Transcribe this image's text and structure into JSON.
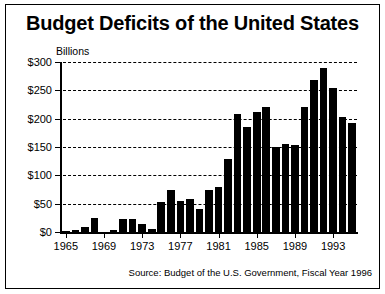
{
  "chart_data": {
    "type": "bar",
    "title": "Budget Deficits of the United States",
    "xlabel": "",
    "ylabel": "Billions",
    "unit_label": "Billions",
    "source": "Source: Budget of the U.S. Government, Fiscal Year 1996",
    "ylim": [
      0,
      300
    ],
    "y_ticks": [
      0,
      50,
      100,
      150,
      200,
      250,
      300
    ],
    "y_tick_labels": [
      "$0",
      "$50",
      "$100",
      "$150",
      "$200",
      "$250",
      "$300"
    ],
    "x_tick_labels": [
      "1965",
      "1969",
      "1973",
      "1977",
      "1981",
      "1985",
      "1989",
      "1993"
    ],
    "grid": true,
    "grid_style": "dashed-horizontal",
    "legend": "none",
    "bar_color": "#000000",
    "categories": [
      "1965",
      "1966",
      "1967",
      "1968",
      "1969",
      "1970",
      "1971",
      "1972",
      "1973",
      "1974",
      "1975",
      "1976",
      "1977",
      "1978",
      "1979",
      "1980",
      "1981",
      "1982",
      "1983",
      "1984",
      "1985",
      "1986",
      "1987",
      "1988",
      "1989",
      "1990",
      "1991",
      "1992",
      "1993",
      "1994",
      "1995"
    ],
    "values": [
      1,
      4,
      9,
      25,
      -3,
      3,
      23,
      23,
      15,
      6,
      53,
      74,
      54,
      59,
      41,
      74,
      79,
      128,
      208,
      185,
      212,
      221,
      150,
      155,
      153,
      221,
      269,
      290,
      255,
      203,
      192
    ]
  }
}
